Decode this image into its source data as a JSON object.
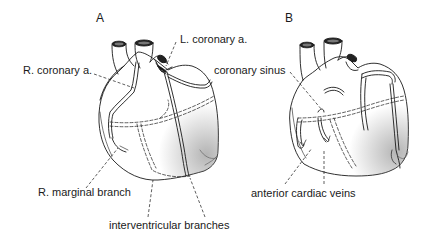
{
  "figure": {
    "panels": [
      {
        "id": "A",
        "letter": "A",
        "labels": {
          "right_coronary": "R. coronary a.",
          "left_coronary": "L. coronary a.",
          "right_marginal": "R. marginal branch",
          "interventricular": "interventricular branches"
        }
      },
      {
        "id": "B",
        "letter": "B",
        "labels": {
          "coronary_sinus": "coronary sinus",
          "anterior_cardiac_veins": "anterior cardiac veins"
        }
      }
    ],
    "colors": {
      "line": "#1a1a1a",
      "background": "#ffffff",
      "shading": "#888888"
    }
  }
}
